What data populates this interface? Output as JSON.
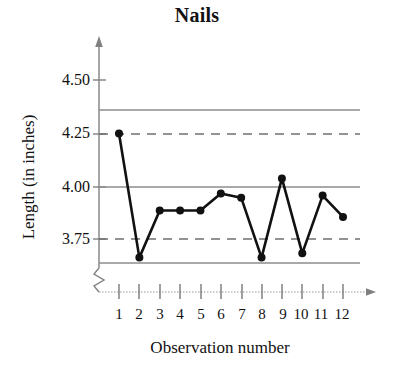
{
  "chart_data": {
    "type": "line",
    "title": "Nails",
    "xlabel": "Observation number",
    "ylabel": "Length (in inches)",
    "x": [
      1,
      2,
      3,
      4,
      5,
      6,
      7,
      8,
      9,
      10,
      11,
      12
    ],
    "categories": [
      "1",
      "2",
      "3",
      "4",
      "5",
      "6",
      "7",
      "8",
      "9",
      "10",
      "11",
      "12"
    ],
    "values": [
      4.25,
      3.67,
      3.89,
      3.89,
      3.89,
      3.97,
      3.95,
      3.67,
      4.04,
      3.69,
      3.96,
      3.86
    ],
    "series": [
      {
        "name": "Length",
        "values": [
          4.25,
          3.67,
          3.89,
          3.89,
          3.89,
          3.97,
          3.95,
          3.67,
          4.04,
          3.69,
          3.96,
          3.86
        ]
      }
    ],
    "ytick_labels": [
      "4.50",
      "4.25",
      "4.00",
      "3.75"
    ],
    "ytick_values": [
      4.5,
      4.25,
      4.0,
      3.75
    ],
    "ylim": [
      3.6,
      4.6
    ],
    "xlim": [
      0.5,
      12.5
    ],
    "grid": false,
    "legend": "none",
    "axis_break": true,
    "reference_lines": [
      {
        "name": "upper-control-limit",
        "value": 4.36,
        "style": "solid"
      },
      {
        "name": "upper-warning-limit",
        "value": 4.25,
        "style": "dashed"
      },
      {
        "name": "center-line",
        "value": 4.0,
        "style": "solid"
      },
      {
        "name": "lower-warning-limit",
        "value": 3.75,
        "style": "dashed"
      },
      {
        "name": "lower-control-limit",
        "value": 3.64,
        "style": "solid"
      }
    ],
    "colors": {
      "line": "#111111",
      "marker": "#111111",
      "reference_line": "#888888",
      "axis": "#777777",
      "background": "#ffffff"
    }
  }
}
